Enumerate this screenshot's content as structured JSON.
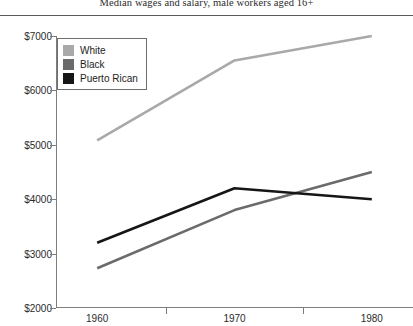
{
  "chart_data": {
    "type": "line",
    "title": "Median wages and salary, male workers aged 16+",
    "xlabel": "",
    "ylabel": "",
    "x": [
      1960,
      1970,
      1980
    ],
    "xtick_labels": [
      "1960",
      "1970",
      "1980"
    ],
    "ytick_labels": [
      "$2000",
      "$3000",
      "$4000",
      "$5000",
      "$6000",
      "$7000"
    ],
    "ytick_values": [
      2000,
      3000,
      4000,
      5000,
      6000,
      7000
    ],
    "xlim": [
      1957,
      1983
    ],
    "ylim": [
      2000,
      7000
    ],
    "grid": false,
    "legend_position": "top-left",
    "series": [
      {
        "name": "White",
        "color": "#a9a9a9",
        "values": [
          5080,
          6550,
          7000
        ]
      },
      {
        "name": "Black",
        "color": "#6b6b6b",
        "values": [
          2730,
          3800,
          4500
        ]
      },
      {
        "name": "Puerto Rican",
        "color": "#161616",
        "values": [
          3200,
          4200,
          4000
        ]
      }
    ]
  },
  "legend": {
    "items": [
      {
        "label": "White",
        "color": "#a9a9a9"
      },
      {
        "label": "Black",
        "color": "#6b6b6b"
      },
      {
        "label": "Puerto Rican",
        "color": "#161616"
      }
    ]
  },
  "colors": {
    "axis": "#7d7d7d",
    "rule": "#5a5a5a",
    "text": "#2b2b2b",
    "background": "#ffffff"
  }
}
